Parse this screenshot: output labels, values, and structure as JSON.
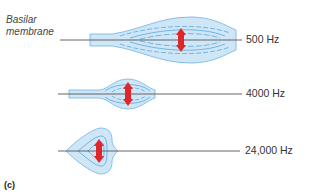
{
  "diagram": {
    "structure_label_line1": "Basilar",
    "structure_label_line2": "membrane",
    "panel_label": "(c)",
    "rows": [
      {
        "frequency": "500 Hz"
      },
      {
        "frequency": "4000 Hz"
      },
      {
        "frequency": "24,000 Hz"
      }
    ],
    "colors": {
      "membrane_fill": "#cfe6f7",
      "membrane_outline": "#4a9fd8",
      "axis_line": "#555555",
      "arrow": "#e0262b"
    }
  }
}
